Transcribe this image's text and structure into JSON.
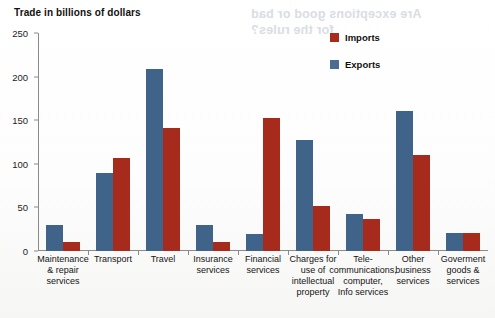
{
  "chart_data": {
    "type": "bar",
    "title": "Trade in billions of dollars",
    "xlabel": "",
    "ylabel": "Trade in billions of dollars",
    "ylim": [
      0,
      250
    ],
    "yticks": [
      0,
      50,
      100,
      150,
      200,
      250
    ],
    "grid": false,
    "legend_position": "top-right",
    "categories": [
      "Maintenance\n& repair\nservices",
      "Transport",
      "Travel",
      "Insurance\nservices",
      "Financial\nservices",
      "Charges for\nuse of\nintellectual\nproperty",
      "Tele-\ncommunications,\ncomputer,\nInfo services",
      "Other\nbusiness\nservices",
      "Goverment\ngoods &\nservices"
    ],
    "series": [
      {
        "name": "Exports",
        "color": "#3f6389",
        "values": [
          30,
          90,
          209,
          30,
          19,
          127,
          43,
          161,
          21
        ]
      },
      {
        "name": "Imports",
        "color": "#a72b1c",
        "values": [
          10,
          107,
          141,
          10,
          152,
          52,
          37,
          110,
          21
        ]
      }
    ]
  },
  "legend": {
    "imports_label": "Imports",
    "exports_label": "Exports"
  },
  "artifacts": {
    "bleed_line_1": "Are exceptions good or bad",
    "bleed_line_2": "for the rules?"
  }
}
